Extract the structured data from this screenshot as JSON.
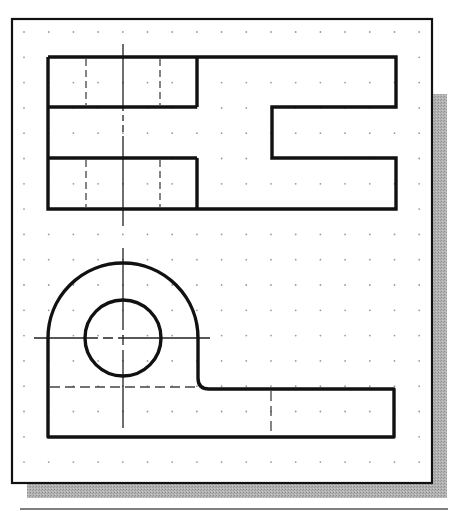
{
  "drawing": {
    "title": "Two-view orthographic drawing on dotted grid",
    "colors": {
      "background": "#ffffff",
      "frame": "#111111",
      "shadow": "#a9a9a9",
      "object_line": "#111111",
      "center_line": "#222222",
      "hidden_line": "#444444",
      "grid_dot": "#9a9a9a",
      "separator": "#555555"
    },
    "frame": {
      "x": 12,
      "y": 19,
      "w": 420,
      "h": 464
    },
    "shadow_offset": 15,
    "grid": {
      "x0": 24,
      "y0": 32,
      "dx": 24.7,
      "dy": 25.3,
      "cols": 17,
      "rows": 18
    },
    "top_view": {
      "outline_points": "48,57 396,57 396,107 272,107 272,158 396,158 396,209 48,209 48,57",
      "inner_lines": [
        {
          "x1": 48,
          "y1": 107,
          "x2": 197,
          "y2": 107
        },
        {
          "x1": 48,
          "y1": 158,
          "x2": 197,
          "y2": 158
        },
        {
          "x1": 197,
          "y1": 57,
          "x2": 197,
          "y2": 107
        },
        {
          "x1": 197,
          "y1": 158,
          "x2": 197,
          "y2": 209
        }
      ],
      "hidden_lines": [
        {
          "x1": 86,
          "y1": 59,
          "x2": 86,
          "y2": 105
        },
        {
          "x1": 160,
          "y1": 59,
          "x2": 160,
          "y2": 105
        },
        {
          "x1": 86,
          "y1": 160,
          "x2": 86,
          "y2": 207
        },
        {
          "x1": 160,
          "y1": 160,
          "x2": 160,
          "y2": 207
        }
      ],
      "center_line": {
        "x": 123,
        "y1": 44,
        "y2": 226
      }
    },
    "front_view": {
      "arc_center": {
        "x": 123,
        "y": 338
      },
      "outer_radius": 75,
      "hole_radius": 38,
      "outline_path": "M48,437 L48,338 A75,75 0 0 1 198,338 L198,378 Q198,389 209,389 L394,389 L394,437 Z",
      "hidden_lines": [
        {
          "x1": 50,
          "y1": 387,
          "x2": 196,
          "y2": 387
        },
        {
          "x1": 271,
          "y1": 391,
          "x2": 271,
          "y2": 435
        }
      ],
      "center_h": {
        "y": 338,
        "x1": 34,
        "x2": 210
      },
      "center_v": {
        "x": 123,
        "y1": 248,
        "y2": 428
      }
    },
    "separator": {
      "x1": 20,
      "y1": 509,
      "x2": 448
    }
  }
}
